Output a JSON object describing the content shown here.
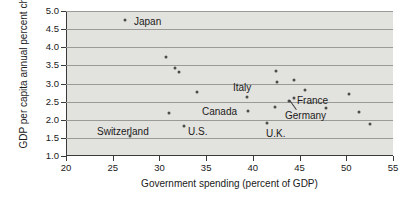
{
  "chart_data": {
    "type": "scatter",
    "title": "",
    "xlabel": "Government spending (percent of GDP)",
    "ylabel": "GDP per capita annual percent change",
    "xlim": [
      20,
      55
    ],
    "ylim": [
      1.0,
      5.0
    ],
    "xticks": [
      20,
      25,
      30,
      35,
      40,
      45,
      50,
      55
    ],
    "yticks": [
      1.0,
      1.5,
      2.0,
      2.5,
      3.0,
      3.5,
      4.0,
      4.5,
      5.0
    ],
    "xtick_labels": [
      "20",
      "25",
      "30",
      "35",
      "40",
      "45",
      "50",
      "55"
    ],
    "ytick_labels": [
      "1.0",
      "1.5",
      "2.0",
      "2.5",
      "3.0",
      "3.5",
      "4.0",
      "4.5",
      "5.0"
    ],
    "grid": "horizontal",
    "legend": "none",
    "plot_background": "#e2e2de",
    "point_color": "#4c4c4c",
    "points": [
      {
        "label": "Japan",
        "x": 26.3,
        "y": 4.76
      },
      {
        "label": "Switzerland",
        "x": 26.8,
        "y": 1.55
      },
      {
        "label": "",
        "x": 30.7,
        "y": 3.74
      },
      {
        "label": "",
        "x": 31.0,
        "y": 2.18
      },
      {
        "label": "",
        "x": 31.7,
        "y": 3.43
      },
      {
        "label": "",
        "x": 32.1,
        "y": 3.33
      },
      {
        "label": "U.S.",
        "x": 32.6,
        "y": 1.82
      },
      {
        "label": "",
        "x": 34.0,
        "y": 2.76
      },
      {
        "label": "",
        "x": 39.4,
        "y": 2.63
      },
      {
        "label": "Canada",
        "x": 39.5,
        "y": 2.25
      },
      {
        "label": "U.K.",
        "x": 41.5,
        "y": 1.92
      },
      {
        "label": "",
        "x": 42.4,
        "y": 2.35
      },
      {
        "label": "Italy",
        "x": 42.5,
        "y": 3.34
      },
      {
        "label": "",
        "x": 42.6,
        "y": 3.03
      },
      {
        "label": "Germany",
        "x": 43.9,
        "y": 2.53
      },
      {
        "label": "France",
        "x": 44.4,
        "y": 2.61
      },
      {
        "label": "",
        "x": 44.4,
        "y": 3.11
      },
      {
        "label": "",
        "x": 45.6,
        "y": 2.83
      },
      {
        "label": "",
        "x": 47.8,
        "y": 2.33
      },
      {
        "label": "",
        "x": 50.3,
        "y": 2.7
      },
      {
        "label": "",
        "x": 51.4,
        "y": 2.21
      },
      {
        "label": "",
        "x": 52.5,
        "y": 1.89
      }
    ],
    "annotations": [
      {
        "text": "Japan",
        "px": 134,
        "py": 17
      },
      {
        "text": "Italy",
        "px": 233,
        "py": 83
      },
      {
        "text": "France",
        "px": 297,
        "py": 96
      },
      {
        "text": "Germany",
        "px": 285,
        "py": 111
      },
      {
        "text": "Canada",
        "px": 202,
        "py": 107
      },
      {
        "text": "Switzerland",
        "px": 97,
        "py": 127
      },
      {
        "text": "U.S.",
        "px": 188,
        "py": 127
      },
      {
        "text": "U.K.",
        "px": 266,
        "py": 129
      }
    ]
  }
}
